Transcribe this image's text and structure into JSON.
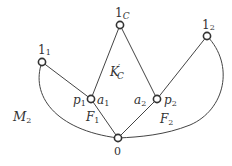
{
  "diagram": {
    "type": "lattice-graph",
    "nodes": [
      {
        "id": "1C",
        "label": "1",
        "sub": "C",
        "x": 120,
        "y": 25
      },
      {
        "id": "1_1",
        "label": "1",
        "sub": "1",
        "x": 42,
        "y": 62
      },
      {
        "id": "1_2",
        "label": "1",
        "sub": "2",
        "x": 207,
        "y": 36
      },
      {
        "id": "a1p1",
        "label_left": "p",
        "label_left_sub": "1",
        "label_right": "a",
        "label_right_sub": "1",
        "x": 91,
        "y": 99
      },
      {
        "id": "a2p2",
        "label_left": "a",
        "label_left_sub": "2",
        "label_right": "p",
        "label_right_sub": "2",
        "x": 157,
        "y": 99
      },
      {
        "id": "0",
        "label": "0",
        "x": 118,
        "y": 138
      }
    ],
    "edges": [
      [
        "1C",
        "a1p1"
      ],
      [
        "1C",
        "a2p2"
      ],
      [
        "1_1",
        "a1p1"
      ],
      [
        "1_2",
        "a2p2"
      ],
      [
        "a1p1",
        "0"
      ],
      [
        "a2p2",
        "0"
      ],
      [
        "1_1",
        "0",
        "curve-left"
      ],
      [
        "1_2",
        "0",
        "curve-right"
      ]
    ],
    "region_labels": {
      "K": "K",
      "K_prime": "′",
      "K_sub": "C",
      "F1": "F",
      "F1_sub": "1",
      "F2": "F",
      "F2_sub": "2",
      "M2": "M",
      "M2_sub": "2"
    },
    "node_labels": {
      "top_main": "1",
      "top_main_sub": "C",
      "left_top": "1",
      "left_top_sub": "1",
      "right_top": "1",
      "right_top_sub": "2",
      "p1": "p",
      "p1_sub": "1",
      "a1": "a",
      "a1_sub": "1",
      "a2": "a",
      "a2_sub": "2",
      "p2": "p",
      "p2_sub": "2",
      "bottom": "0"
    }
  }
}
